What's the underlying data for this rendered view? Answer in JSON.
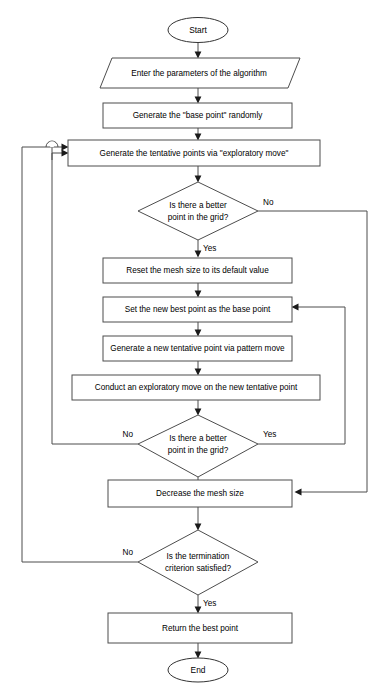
{
  "diagram": {
    "type": "flowchart",
    "background_color": "#ffffff",
    "line_color": "#4d4d4d",
    "text_color": "#000000"
  },
  "nodes": {
    "start": {
      "label": "Start",
      "shape": "ellipse"
    },
    "input_params": {
      "label": "Enter the parameters of the algorithm",
      "shape": "parallelogram"
    },
    "gen_base_point": {
      "label": "Generate the \"base point\" randomly",
      "shape": "rectangle"
    },
    "gen_tentative_points": {
      "label": "Generate the tentative points via \"exploratory move\"",
      "shape": "rectangle"
    },
    "decision_better_1": {
      "label_line1": "Is there a better",
      "label_line2": "point in the grid?",
      "shape": "diamond"
    },
    "reset_mesh": {
      "label": "Reset the mesh size to its default value",
      "shape": "rectangle"
    },
    "set_best_point": {
      "label": "Set the new best point as the base point",
      "shape": "rectangle"
    },
    "gen_pattern_move": {
      "label": "Generate a new tentative point via pattern move",
      "shape": "rectangle"
    },
    "conduct_exploratory": {
      "label": "Conduct an exploratory move on the new tentative point",
      "shape": "rectangle"
    },
    "decision_better_2": {
      "label_line1": "Is there a better",
      "label_line2": "point in the grid?",
      "shape": "diamond"
    },
    "decrease_mesh": {
      "label": "Decrease the mesh size",
      "shape": "rectangle"
    },
    "decision_termination": {
      "label_line1": "Is the termination",
      "label_line2": "criterion satisfied?",
      "shape": "diamond"
    },
    "return_best": {
      "label": "Return the best point",
      "shape": "rectangle"
    },
    "end": {
      "label": "End",
      "shape": "ellipse"
    }
  },
  "edge_labels": {
    "d1_no": "No",
    "d1_yes": "Yes",
    "d2_no": "No",
    "d2_yes": "Yes",
    "d3_no": "No",
    "d3_yes": "Yes"
  }
}
